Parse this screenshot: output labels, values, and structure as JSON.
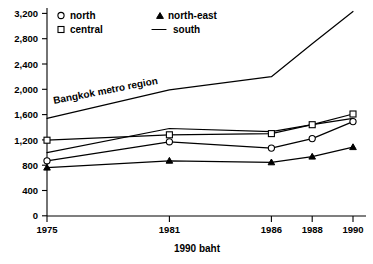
{
  "chart_data": {
    "type": "line",
    "title": "",
    "subtitle": "",
    "xlabel": "1990 baht",
    "ylabel": "",
    "x": [
      "1975",
      "1981",
      "1986",
      "1988",
      "1990"
    ],
    "x_numeric": [
      1975,
      1981,
      1986,
      1988,
      1990
    ],
    "xlim": [
      1975,
      1990
    ],
    "ylim": [
      0,
      3400
    ],
    "yticks": [
      0,
      400,
      800,
      1200,
      1600,
      2000,
      2400,
      2800,
      3200
    ],
    "ytick_labels": [
      "0",
      "400",
      "800",
      "1,200",
      "1,600",
      "2,000",
      "2,400",
      "2,800",
      "3,200"
    ],
    "xtick_labels": [
      "1975",
      "1981",
      "1986",
      "1988",
      "1990"
    ],
    "grid": false,
    "legend_position": "top-left",
    "series": [
      {
        "name": "north",
        "marker": "circle-open",
        "values": [
          870,
          1170,
          1070,
          1220,
          1490
        ]
      },
      {
        "name": "central",
        "marker": "square-open",
        "values": [
          1195,
          1280,
          1300,
          1440,
          1610
        ]
      },
      {
        "name": "north-east",
        "marker": "triangle-solid",
        "values": [
          760,
          870,
          845,
          935,
          1085
        ]
      },
      {
        "name": "south",
        "marker": "none",
        "values": [
          1000,
          1380,
          1330,
          1440,
          1540
        ]
      },
      {
        "name": "Bangkok metro region",
        "marker": "none",
        "labelled_inline": true,
        "values": [
          1540,
          1990,
          2200,
          2720,
          3230
        ]
      }
    ],
    "annotations": [
      {
        "text": "Bangkok metro region",
        "x": 1978.4,
        "y": 1790,
        "rotation": -11
      }
    ]
  },
  "legend": {
    "items": [
      {
        "label": "north",
        "marker": "circle-open"
      },
      {
        "label": "north-east",
        "marker": "triangle-solid"
      },
      {
        "label": "central",
        "marker": "square-open"
      },
      {
        "label": "south",
        "marker": "line"
      }
    ]
  },
  "axis": {
    "x_title": "1990 baht"
  },
  "colors": {
    "ink": "#000000",
    "background": "#ffffff"
  }
}
